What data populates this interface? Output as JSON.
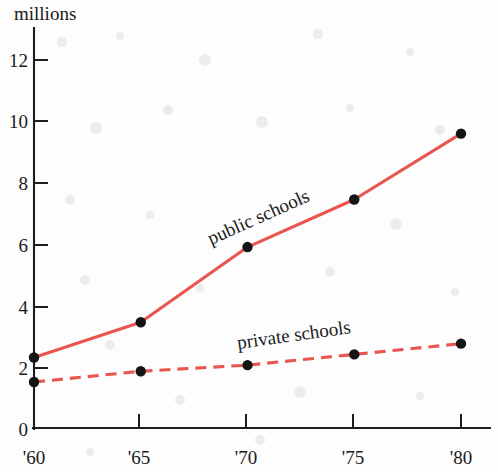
{
  "chart_data": {
    "type": "line",
    "title": "",
    "ylabel": "millions",
    "xlabel": "",
    "x": [
      "'60",
      "'65",
      "'70",
      "'75",
      "'80"
    ],
    "categories": [
      "'60",
      "'65",
      "'70",
      "'75",
      "'80"
    ],
    "xlim": [
      1960,
      1980
    ],
    "ylim": [
      0,
      13
    ],
    "ytick_labels": [
      "0",
      "2",
      "4",
      "6",
      "8",
      "10",
      "12"
    ],
    "ytick_values": [
      0,
      2,
      4,
      6,
      8,
      10,
      12
    ],
    "grid": false,
    "legend": "inline-labels",
    "series": [
      {
        "name": "public schools",
        "label": "public schools",
        "style": "solid",
        "color": "#e8564f",
        "marker": "filled-circle",
        "marker_color": "#141414",
        "values": [
          2.3,
          3.45,
          5.9,
          7.45,
          9.6
        ]
      },
      {
        "name": "private schools",
        "label": "private schools",
        "style": "dashed",
        "color": "#e8564f",
        "marker": "filled-circle",
        "marker_color": "#141414",
        "values": [
          1.5,
          1.85,
          2.05,
          2.4,
          2.75
        ]
      }
    ]
  },
  "axes": {
    "y_axis_title": "millions",
    "y_ticks": [
      {
        "label": "12"
      },
      {
        "label": "10"
      },
      {
        "label": "8"
      },
      {
        "label": "6"
      },
      {
        "label": "4"
      },
      {
        "label": "2"
      },
      {
        "label": "0"
      }
    ],
    "x_ticks": [
      {
        "label": "'60"
      },
      {
        "label": "'65"
      },
      {
        "label": "'70"
      },
      {
        "label": "'75"
      },
      {
        "label": "'80"
      }
    ]
  },
  "annotations": {
    "public_label": "public schools",
    "private_label": "private schools"
  },
  "colors": {
    "line": "#e8564f",
    "marker": "#141414",
    "axis": "#1d1d1d",
    "text": "#1a1a1a",
    "background": "#fdfdfd"
  }
}
